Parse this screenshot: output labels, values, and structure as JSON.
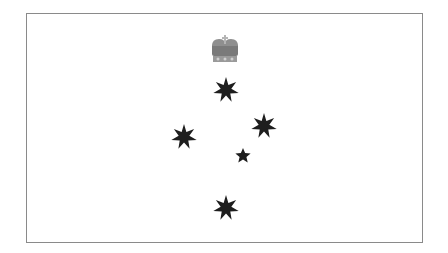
{
  "flag": {
    "description": "State flag emblem with crown above the Southern Cross constellation (grayscale)",
    "colors": {
      "field": "#ffffff",
      "border": "#8a8a8a",
      "stars": "#1e1e1e",
      "crown": "#7a7a7a",
      "crown_highlight": "#b5b5b5"
    },
    "emblems": {
      "crown": {
        "name": "crown"
      },
      "stars": [
        {
          "name": "star-top",
          "points": 7
        },
        {
          "name": "star-left",
          "points": 7
        },
        {
          "name": "star-right",
          "points": 7
        },
        {
          "name": "star-small",
          "points": 5
        },
        {
          "name": "star-bottom",
          "points": 7
        }
      ]
    }
  }
}
